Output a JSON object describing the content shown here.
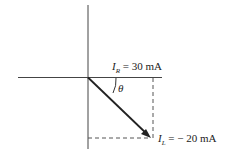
{
  "diagram": {
    "type": "phasor-diagram",
    "colors": {
      "line": "#333333",
      "text": "#222222",
      "background": "#ffffff"
    },
    "axes": {
      "horizontal": "real-axis",
      "vertical": "imaginary-axis"
    },
    "angle_label": "θ",
    "labels": {
      "ir": {
        "symbol": "I",
        "subscript": "R",
        "equals": " = ",
        "value": "30 mA"
      },
      "il": {
        "symbol": "I",
        "subscript": "L",
        "equals": " = ",
        "value": "− 20 mA"
      }
    },
    "phasor": {
      "description": "resultant current vector from origin to (IR, IL)"
    }
  }
}
